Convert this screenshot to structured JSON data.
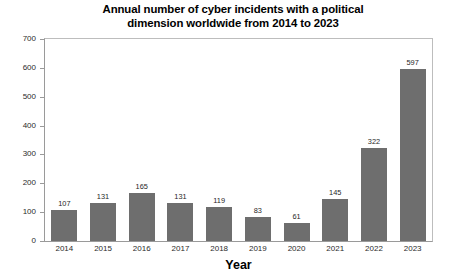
{
  "chart_data": {
    "type": "bar",
    "title": "Annual number of cyber incidents with a political dimension worldwide from 2014 to 2023",
    "title_line1": "Annual number of cyber incidents with a political",
    "title_line2": "dimension worldwide from 2014 to 2023",
    "xlabel": "Year",
    "ylabel": "",
    "categories": [
      "2014",
      "2015",
      "2016",
      "2017",
      "2018",
      "2019",
      "2020",
      "2021",
      "2022",
      "2023"
    ],
    "values": [
      107,
      131,
      165,
      131,
      119,
      83,
      61,
      145,
      322,
      597
    ],
    "value_labels": [
      "107",
      "131",
      "165",
      "131",
      "119",
      "83",
      "61",
      "145",
      "322",
      "597"
    ],
    "ylim": [
      0,
      700
    ],
    "yticks": [
      0,
      100,
      200,
      300,
      400,
      500,
      600,
      700
    ],
    "ytick_labels": [
      "0",
      "100",
      "200",
      "300",
      "400",
      "500",
      "600",
      "700"
    ],
    "grid": false,
    "legend": false,
    "bar_color": "#6e6e6e",
    "frame_color": "#9a9a9a",
    "background": "#ffffff"
  }
}
